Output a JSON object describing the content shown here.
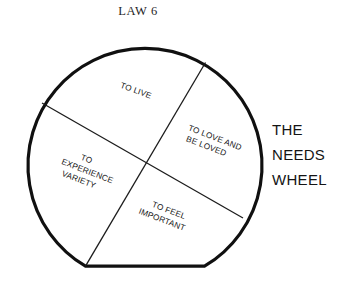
{
  "title": "LAW 6",
  "side_caption": {
    "line1": "THE",
    "line2": "NEEDS",
    "line3": "WHEEL"
  },
  "wheel": {
    "segments": [
      {
        "id": "to-live",
        "line1": "TO LIVE",
        "line2": "",
        "line3": ""
      },
      {
        "id": "to-love-and-be-loved",
        "line1": "TO LOVE AND",
        "line2": "BE  LOVED",
        "line3": ""
      },
      {
        "id": "to-experience-variety",
        "line1": "TO",
        "line2": "EXPERIENCE",
        "line3": "VARIETY"
      },
      {
        "id": "to-feel-important",
        "line1": "TO FEEL",
        "line2": "IMPORTANT",
        "line3": ""
      }
    ]
  },
  "colors": {
    "ink": "#101010",
    "divider": "#1c1c1c",
    "background": "#ffffff"
  }
}
